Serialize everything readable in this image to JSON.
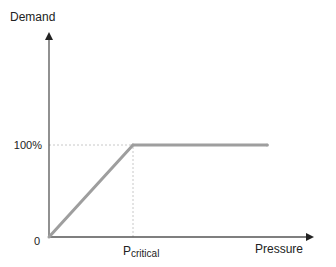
{
  "diagram": {
    "y_axis_label": "Demand",
    "x_axis_label": "Pressure",
    "origin_label": "0",
    "y_level_label": "100%",
    "x_marker_label_main": "P",
    "x_marker_label_sub": "critical"
  },
  "chart_data": {
    "type": "line",
    "title": "",
    "xlabel": "Pressure",
    "ylabel": "Demand",
    "x_tick_labels": [
      "0",
      "P_critical"
    ],
    "y_tick_labels": [
      "0",
      "100%"
    ],
    "xlim": [
      0,
      3.2
    ],
    "ylim": [
      0,
      2.3
    ],
    "grid": false,
    "legend": "none",
    "series": [
      {
        "name": "Demand",
        "color": "#9e9e9e",
        "points": [
          {
            "x": 0,
            "y": 0
          },
          {
            "x": 1,
            "y": 1
          },
          {
            "x": 2.6,
            "y": 1
          }
        ]
      }
    ],
    "reference_lines": [
      {
        "orientation": "horizontal",
        "value": 1,
        "label": "100%",
        "style": "dotted",
        "from_x": 0,
        "to_x": 1
      },
      {
        "orientation": "vertical",
        "value": 1,
        "label": "P_critical",
        "style": "dotted",
        "from_y": 0,
        "to_y": 1
      }
    ],
    "colors": {
      "axis": "#555555",
      "curve": "#9e9e9e",
      "guide": "#c8c8c8",
      "text": "#222222"
    }
  }
}
